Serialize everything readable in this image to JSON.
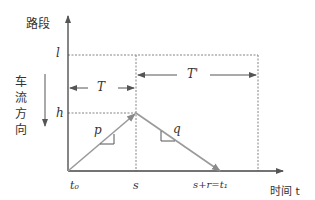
{
  "diagram": {
    "y_axis_label": "路段",
    "x_axis_label": "时间 t",
    "flow_direction_label": [
      "车",
      "流",
      "方",
      "向"
    ],
    "y_ticks": {
      "top": "l",
      "mid": "h"
    },
    "x_ticks": {
      "origin": "t₀",
      "mid": "s",
      "end": "s+r=t₁"
    },
    "intervals": {
      "first": "T",
      "second": "T'"
    },
    "slopes": {
      "rising": "p",
      "falling": "q"
    },
    "colors": {
      "axis": "#444444",
      "trajectory": "#9a9a9a",
      "dashed": "#777777"
    }
  }
}
